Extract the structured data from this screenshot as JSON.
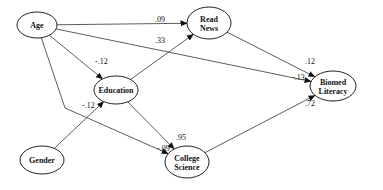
{
  "diagram": {
    "type": "path-model",
    "nodes": [
      {
        "id": "age",
        "label_lines": [
          "Age"
        ],
        "cx": 37,
        "cy": 25,
        "rx": 20,
        "ry": 13
      },
      {
        "id": "read_news",
        "label_lines": [
          "Read",
          "News"
        ],
        "cx": 209,
        "cy": 23,
        "rx": 22,
        "ry": 16
      },
      {
        "id": "education",
        "label_lines": [
          "Education"
        ],
        "cx": 116,
        "cy": 90,
        "rx": 22,
        "ry": 14
      },
      {
        "id": "biomed_literacy",
        "label_lines": [
          "Biomed",
          "Literacy"
        ],
        "cx": 333,
        "cy": 86,
        "rx": 23,
        "ry": 15
      },
      {
        "id": "gender",
        "label_lines": [
          "Gender"
        ],
        "cx": 42,
        "cy": 160,
        "rx": 22,
        "ry": 14
      },
      {
        "id": "college_science",
        "label_lines": [
          "College",
          "Science"
        ],
        "cx": 187,
        "cy": 162,
        "rx": 22,
        "ry": 16
      }
    ],
    "edges": [
      {
        "from": "age",
        "to": "read_news",
        "label": ".09",
        "lx": 155,
        "ly": 22
      },
      {
        "from": "age",
        "to": "education",
        "label": "-.12",
        "lx": 95,
        "ly": 64
      },
      {
        "from": "age",
        "to": "biomed_literacy",
        "label": "-.13",
        "lx": 292,
        "ly": 80
      },
      {
        "from": "age",
        "to": "college_science",
        "label": "-.09",
        "lx": 157,
        "ly": 151
      },
      {
        "from": "education",
        "to": "read_news",
        "label": ".33",
        "lx": 155,
        "ly": 43
      },
      {
        "from": "education",
        "to": "college_science",
        "label": ".95",
        "lx": 176,
        "ly": 140
      },
      {
        "from": "gender",
        "to": "education",
        "label": "-.12",
        "lx": 82,
        "ly": 108
      },
      {
        "from": "read_news",
        "to": "biomed_literacy",
        "label": ".12",
        "lx": 305,
        "ly": 64
      },
      {
        "from": "college_science",
        "to": "biomed_literacy",
        "label": ".72",
        "lx": 305,
        "ly": 106
      }
    ]
  }
}
